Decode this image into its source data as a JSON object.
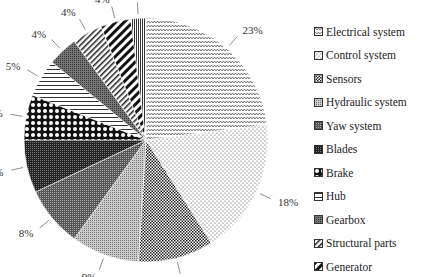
{
  "chart_data": {
    "type": "pie",
    "title": "",
    "categories": [
      "Electrical system",
      "Control system",
      "Sensors",
      "Hydraulic system",
      "Yaw system",
      "Blades",
      "Brake",
      "Hub",
      "Gearbox",
      "Structural parts",
      "Generator",
      ""
    ],
    "values": [
      23,
      18,
      10,
      9,
      8,
      7,
      6,
      5,
      4,
      4,
      4,
      2
    ],
    "labels": [
      "23%",
      "18%",
      "10%",
      "9%",
      "8%",
      "7%",
      "6%",
      "5%",
      "4%",
      "4%",
      "4%",
      "2%"
    ],
    "legend_position": "right",
    "start_angle_deg": 0,
    "direction": "clockwise"
  },
  "legend": {
    "items": [
      {
        "label": "Electrical system",
        "pattern": "zigzag"
      },
      {
        "label": "Control system",
        "pattern": "sparse-dots"
      },
      {
        "label": "Sensors",
        "pattern": "checker"
      },
      {
        "label": "Hydraulic system",
        "pattern": "fine-dots"
      },
      {
        "label": "Yaw system",
        "pattern": "grid"
      },
      {
        "label": "Blades",
        "pattern": "dense-grid"
      },
      {
        "label": "Brake",
        "pattern": "big-checker"
      },
      {
        "label": "Hub",
        "pattern": "horizontal"
      },
      {
        "label": "Gearbox",
        "pattern": "dense-check"
      },
      {
        "label": "Structural parts",
        "pattern": "diagonal-thin"
      },
      {
        "label": "Generator",
        "pattern": "diagonal-thick"
      }
    ]
  }
}
